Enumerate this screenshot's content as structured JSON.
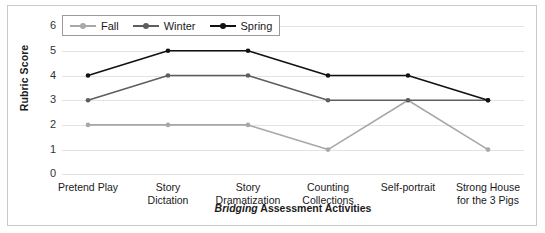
{
  "chart_data": {
    "type": "line",
    "title": "",
    "xlabel_parts": {
      "emphasis": "Bridging",
      "rest": " Assessment Activities"
    },
    "xlabel": "Bridging Assessment Activities",
    "ylabel": "Rubric Score",
    "ylim": [
      0,
      6
    ],
    "yticks": [
      6,
      5,
      4,
      3,
      2,
      1,
      0
    ],
    "grid": true,
    "legend_position": "top-left",
    "categories": [
      "Pretend Play",
      "Story Dictation",
      "Story Dramatization",
      "Counting Collections",
      "Self-portrait",
      "Strong House for the 3 Pigs"
    ],
    "category_lines": [
      [
        "Pretend Play"
      ],
      [
        "Story",
        "Dictation"
      ],
      [
        "Story",
        "Dramatization"
      ],
      [
        "Counting",
        "Collections"
      ],
      [
        "Self-portrait"
      ],
      [
        "Strong House",
        "for the 3 Pigs"
      ]
    ],
    "series": [
      {
        "name": "Fall",
        "color": "#a8a8a8",
        "values": [
          2,
          2,
          2,
          1,
          3,
          1
        ]
      },
      {
        "name": "Winter",
        "color": "#5e5e5e",
        "values": [
          3,
          4,
          4,
          3,
          3,
          3
        ]
      },
      {
        "name": "Spring",
        "color": "#111111",
        "values": [
          4,
          5,
          5,
          4,
          4,
          3
        ]
      }
    ]
  },
  "legend": {
    "items": [
      {
        "label": "Fall",
        "color": "#a8a8a8"
      },
      {
        "label": "Winter",
        "color": "#5e5e5e"
      },
      {
        "label": "Spring",
        "color": "#111111"
      }
    ]
  },
  "axes": {
    "y_title": "Rubric Score",
    "y_ticks": [
      "6",
      "5",
      "4",
      "3",
      "2",
      "1",
      "0"
    ]
  },
  "colors": {
    "frame": "#c9c9c9",
    "grid": "#e3e3e3",
    "text": "#1a1a1a",
    "background": "#ffffff"
  }
}
